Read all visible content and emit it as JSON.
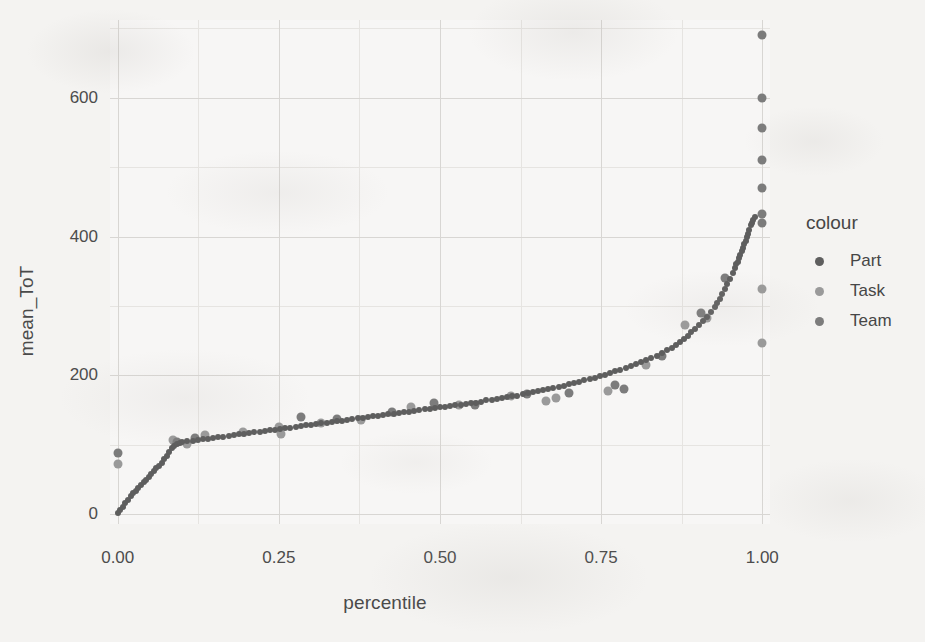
{
  "chart_data": {
    "type": "scatter",
    "title": "",
    "xlabel": "percentile",
    "ylabel": "mean_ToT",
    "xlim": [
      -0.012,
      1.012
    ],
    "ylim": [
      -14,
      712
    ],
    "xticks": [
      "0.00",
      "0.25",
      "0.50",
      "0.75",
      "1.00"
    ],
    "xtick_values": [
      0.0,
      0.25,
      0.5,
      0.75,
      1.0
    ],
    "yticks": [
      "0",
      "200",
      "400",
      "600"
    ],
    "ytick_values": [
      0,
      200,
      400,
      600
    ],
    "grid": true,
    "grid_major": true,
    "grid_minor": true,
    "legend_title": "colour",
    "legend_position": "right",
    "colors": {
      "Part": "#5e5e5e",
      "Task": "#9a9a9a",
      "Team": "#7c7c7c",
      "panel_grid_major": "#d8d6d3",
      "panel_grid_minor": "#e6e4e1",
      "text": "#4a4a4a",
      "background": "#f4f3f1"
    },
    "series": [
      {
        "name": "Part",
        "color": "#5e5e5e",
        "point_size": 6,
        "points": [
          [
            0.0,
            2
          ],
          [
            0.004,
            6
          ],
          [
            0.008,
            11
          ],
          [
            0.012,
            16
          ],
          [
            0.016,
            21
          ],
          [
            0.02,
            26
          ],
          [
            0.024,
            30
          ],
          [
            0.028,
            34
          ],
          [
            0.032,
            38
          ],
          [
            0.036,
            42
          ],
          [
            0.04,
            46
          ],
          [
            0.044,
            50
          ],
          [
            0.048,
            54
          ],
          [
            0.052,
            58
          ],
          [
            0.056,
            62
          ],
          [
            0.06,
            66
          ],
          [
            0.064,
            70
          ],
          [
            0.068,
            74
          ],
          [
            0.072,
            79
          ],
          [
            0.076,
            84
          ],
          [
            0.08,
            90
          ],
          [
            0.084,
            95
          ],
          [
            0.088,
            99
          ],
          [
            0.092,
            101
          ],
          [
            0.096,
            103
          ],
          [
            0.1,
            104
          ],
          [
            0.108,
            105
          ],
          [
            0.116,
            106
          ],
          [
            0.124,
            107
          ],
          [
            0.132,
            108
          ],
          [
            0.14,
            109
          ],
          [
            0.148,
            110
          ],
          [
            0.156,
            111
          ],
          [
            0.164,
            112
          ],
          [
            0.172,
            113
          ],
          [
            0.18,
            114
          ],
          [
            0.188,
            115
          ],
          [
            0.196,
            116
          ],
          [
            0.204,
            117
          ],
          [
            0.212,
            118
          ],
          [
            0.22,
            119
          ],
          [
            0.228,
            120
          ],
          [
            0.236,
            121
          ],
          [
            0.244,
            122
          ],
          [
            0.252,
            123
          ],
          [
            0.26,
            124
          ],
          [
            0.268,
            125
          ],
          [
            0.276,
            126
          ],
          [
            0.284,
            127
          ],
          [
            0.292,
            128
          ],
          [
            0.3,
            129
          ],
          [
            0.308,
            130
          ],
          [
            0.316,
            131
          ],
          [
            0.324,
            132
          ],
          [
            0.332,
            133
          ],
          [
            0.34,
            134
          ],
          [
            0.348,
            135
          ],
          [
            0.356,
            136
          ],
          [
            0.364,
            137
          ],
          [
            0.372,
            138
          ],
          [
            0.38,
            139
          ],
          [
            0.388,
            140
          ],
          [
            0.396,
            141
          ],
          [
            0.404,
            142
          ],
          [
            0.412,
            143
          ],
          [
            0.42,
            144
          ],
          [
            0.428,
            145
          ],
          [
            0.436,
            146
          ],
          [
            0.444,
            147
          ],
          [
            0.452,
            148
          ],
          [
            0.46,
            149
          ],
          [
            0.468,
            150
          ],
          [
            0.476,
            151
          ],
          [
            0.484,
            152
          ],
          [
            0.492,
            153
          ],
          [
            0.5,
            154
          ],
          [
            0.508,
            155
          ],
          [
            0.516,
            156
          ],
          [
            0.524,
            157
          ],
          [
            0.532,
            158
          ],
          [
            0.54,
            159
          ],
          [
            0.548,
            160
          ],
          [
            0.556,
            161
          ],
          [
            0.564,
            162
          ],
          [
            0.572,
            164
          ],
          [
            0.58,
            165
          ],
          [
            0.588,
            166
          ],
          [
            0.596,
            167
          ],
          [
            0.604,
            169
          ],
          [
            0.612,
            170
          ],
          [
            0.62,
            171
          ],
          [
            0.628,
            173
          ],
          [
            0.636,
            174
          ],
          [
            0.644,
            176
          ],
          [
            0.652,
            177
          ],
          [
            0.66,
            179
          ],
          [
            0.668,
            180
          ],
          [
            0.676,
            182
          ],
          [
            0.684,
            184
          ],
          [
            0.692,
            185
          ],
          [
            0.7,
            187
          ],
          [
            0.708,
            189
          ],
          [
            0.716,
            191
          ],
          [
            0.724,
            193
          ],
          [
            0.732,
            195
          ],
          [
            0.74,
            197
          ],
          [
            0.748,
            199
          ],
          [
            0.756,
            201
          ],
          [
            0.764,
            203
          ],
          [
            0.772,
            206
          ],
          [
            0.78,
            208
          ],
          [
            0.788,
            211
          ],
          [
            0.796,
            213
          ],
          [
            0.804,
            216
          ],
          [
            0.812,
            219
          ],
          [
            0.82,
            222
          ],
          [
            0.828,
            225
          ],
          [
            0.836,
            228
          ],
          [
            0.844,
            232
          ],
          [
            0.852,
            236
          ],
          [
            0.86,
            240
          ],
          [
            0.866,
            244
          ],
          [
            0.872,
            248
          ],
          [
            0.878,
            252
          ],
          [
            0.884,
            257
          ],
          [
            0.89,
            262
          ],
          [
            0.896,
            267
          ],
          [
            0.902,
            272
          ],
          [
            0.908,
            278
          ],
          [
            0.914,
            284
          ],
          [
            0.92,
            291
          ],
          [
            0.926,
            298
          ],
          [
            0.93,
            304
          ],
          [
            0.934,
            310
          ],
          [
            0.938,
            317
          ],
          [
            0.942,
            324
          ],
          [
            0.946,
            331
          ],
          [
            0.95,
            339
          ],
          [
            0.954,
            347
          ],
          [
            0.958,
            355
          ],
          [
            0.96,
            360
          ],
          [
            0.962,
            364
          ],
          [
            0.964,
            369
          ],
          [
            0.966,
            374
          ],
          [
            0.968,
            379
          ],
          [
            0.97,
            384
          ],
          [
            0.972,
            389
          ],
          [
            0.974,
            394
          ],
          [
            0.976,
            399
          ],
          [
            0.978,
            404
          ],
          [
            0.98,
            410
          ],
          [
            0.982,
            416
          ],
          [
            0.984,
            420
          ],
          [
            0.986,
            424
          ],
          [
            0.988,
            428
          ]
        ]
      },
      {
        "name": "Task",
        "color": "#9a9a9a",
        "point_size": 9,
        "points": [
          [
            0.0,
            73
          ],
          [
            0.085,
            107
          ],
          [
            0.108,
            101
          ],
          [
            0.135,
            114
          ],
          [
            0.195,
            118
          ],
          [
            0.25,
            126
          ],
          [
            0.253,
            116
          ],
          [
            0.315,
            131
          ],
          [
            0.378,
            136
          ],
          [
            0.455,
            155
          ],
          [
            0.53,
            157
          ],
          [
            0.61,
            170
          ],
          [
            0.665,
            163
          ],
          [
            0.68,
            168
          ],
          [
            0.76,
            178
          ],
          [
            0.82,
            215
          ],
          [
            0.88,
            272
          ],
          [
            0.915,
            283
          ],
          [
            1.0,
            247
          ],
          [
            1.0,
            325
          ]
        ]
      },
      {
        "name": "Team",
        "color": "#7c7c7c",
        "point_size": 9,
        "points": [
          [
            0.0,
            88
          ],
          [
            0.092,
            104
          ],
          [
            0.12,
            110
          ],
          [
            0.285,
            140
          ],
          [
            0.34,
            137
          ],
          [
            0.425,
            148
          ],
          [
            0.49,
            160
          ],
          [
            0.555,
            158
          ],
          [
            0.635,
            173
          ],
          [
            0.7,
            174
          ],
          [
            0.772,
            186
          ],
          [
            0.785,
            181
          ],
          [
            0.845,
            228
          ],
          [
            0.905,
            290
          ],
          [
            0.942,
            340
          ],
          [
            1.0,
            690
          ],
          [
            1.0,
            600
          ],
          [
            1.0,
            556
          ],
          [
            1.0,
            510
          ],
          [
            1.0,
            470
          ],
          [
            1.0,
            432
          ],
          [
            1.0,
            420
          ]
        ]
      }
    ]
  },
  "legend": {
    "title": "colour",
    "entries": [
      {
        "label": "Part",
        "color": "#5e5e5e"
      },
      {
        "label": "Task",
        "color": "#9a9a9a"
      },
      {
        "label": "Team",
        "color": "#7c7c7c"
      }
    ]
  },
  "axes": {
    "x_title": "percentile",
    "y_title": "mean_ToT"
  }
}
